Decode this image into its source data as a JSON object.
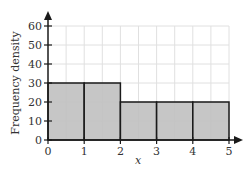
{
  "chart_data": {
    "type": "histogram",
    "title": "",
    "xlabel": "x",
    "ylabel": "Frequency density",
    "xlim": [
      0,
      5
    ],
    "ylim": [
      0,
      60
    ],
    "x_ticks": [
      0,
      1,
      2,
      3,
      4,
      5
    ],
    "y_ticks": [
      0,
      10,
      20,
      30,
      40,
      50,
      60
    ],
    "grid": true,
    "grid_minor_x_step": 0.5,
    "grid_y_step": 10,
    "bins": [
      {
        "from": 0,
        "to": 1,
        "value": 30
      },
      {
        "from": 1,
        "to": 2,
        "value": 30
      },
      {
        "from": 2,
        "to": 3,
        "value": 20
      },
      {
        "from": 3,
        "to": 4,
        "value": 20
      },
      {
        "from": 4,
        "to": 5,
        "value": 20
      }
    ],
    "colors": {
      "bar_fill": "#c0c0c0",
      "bar_edge": "#1a1a1a",
      "grid": "#e0e0e0",
      "axis": "#1a1a1a"
    }
  },
  "labels": {
    "xlabel": "x",
    "ylabel": "Frequency density"
  }
}
